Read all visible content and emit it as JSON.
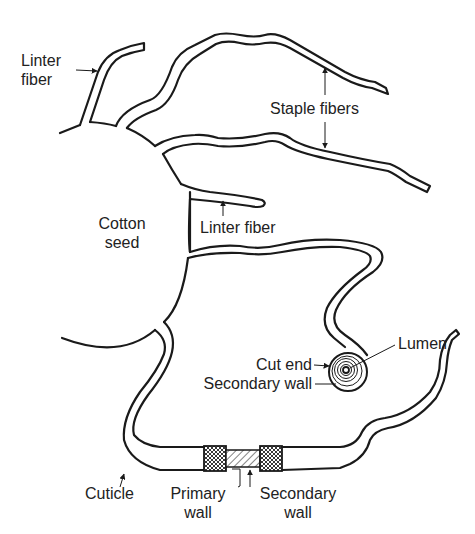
{
  "figure": {
    "labels": {
      "linter_fiber_top": [
        "Linter",
        "fiber"
      ],
      "staple_fibers": "Staple fibers",
      "cotton_seed": [
        "Cotton",
        "seed"
      ],
      "linter_fiber_mid": "Linter fiber",
      "lumen": "Lumen",
      "cut_end": "Cut end",
      "secondary_wall_end": "Secondary wall",
      "cuticle": "Cuticle",
      "primary_wall": [
        "Primary",
        "wall"
      ],
      "secondary_wall_section": [
        "Secondary",
        "wall"
      ]
    },
    "colors": {
      "line": "#1a1a1a",
      "text": "#222222",
      "background": "#ffffff"
    }
  }
}
